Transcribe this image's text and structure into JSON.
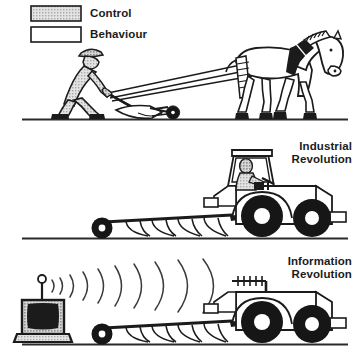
{
  "diagram": {
    "title_absent": "",
    "legend": {
      "items": [
        {
          "label": "Control",
          "swatch": "stippled-gray",
          "fill": "#d2d2d2"
        },
        {
          "label": "Behaviour",
          "swatch": "white",
          "fill": "#ffffff"
        }
      ]
    },
    "panels": [
      {
        "id": "panel-horse-plough",
        "label": "",
        "control_element": "farmer",
        "behaviour_element": "horse",
        "items": [
          "farmer",
          "horse",
          "plough",
          "reins",
          "ground-line"
        ]
      },
      {
        "id": "panel-industrial",
        "label": "Industrial Revolution",
        "label_lines": [
          "Industrial",
          "Revolution"
        ],
        "control_element": "tractor-driver",
        "behaviour_element": "tractor",
        "items": [
          "tractor",
          "tractor-driver",
          "plough",
          "ground-line"
        ]
      },
      {
        "id": "panel-information",
        "label": "Information Revolution",
        "label_lines": [
          "Information",
          "Revolution"
        ],
        "control_element": "remote-control-unit",
        "behaviour_element": "tractor",
        "items": [
          "remote-control-unit",
          "radio-waves",
          "receiving-antenna",
          "tractor",
          "plough",
          "ground-line"
        ]
      }
    ],
    "colors": {
      "ink": "#1b1b1b",
      "control_fill": "#d2d2d2",
      "behaviour_fill": "#ffffff",
      "tyre_black": "#161616",
      "ground": "#2a2a2a"
    },
    "radio_wave_count": 10,
    "antenna_element_count": 5
  }
}
